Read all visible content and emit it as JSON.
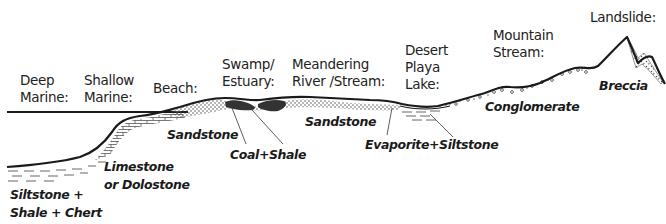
{
  "diagram": {
    "title": "",
    "environments": [
      {
        "id": "deep-marine",
        "label": "Deep\nMarine:"
      },
      {
        "id": "shallow-marine",
        "label": "Shallow\nMarine:"
      },
      {
        "id": "beach",
        "label": "Beach:"
      },
      {
        "id": "swamp-estuary",
        "label": "Swamp/\nEstuary:"
      },
      {
        "id": "meandering-river",
        "label": "Meandering\nRiver /Stream:"
      },
      {
        "id": "desert-playa-lake",
        "label": "Desert\nPlaya\nLake:"
      },
      {
        "id": "mountain-stream",
        "label": "Mountain\nStream:"
      },
      {
        "id": "landslide",
        "label": "Landslide:"
      }
    ],
    "rocks": [
      {
        "id": "siltstone-shale-chert",
        "label": "Siltstone +\nShale + Chert"
      },
      {
        "id": "limestone-dolostone",
        "label": "Limestone\nor Dolostone"
      },
      {
        "id": "sandstone-beach",
        "label": "Sandstone"
      },
      {
        "id": "coal-shale",
        "label": "Coal+Shale"
      },
      {
        "id": "sandstone-river",
        "label": "Sandstone"
      },
      {
        "id": "evaporite-siltstone",
        "label": "Evaporite+Siltstone"
      },
      {
        "id": "conglomerate",
        "label": "Conglomerate"
      },
      {
        "id": "breccia",
        "label": "Breccia"
      }
    ],
    "colors": {
      "line": "#1a1a1a",
      "fill_dark": "#3a3a3a",
      "pattern": "#555555",
      "background": "#ffffff"
    }
  }
}
